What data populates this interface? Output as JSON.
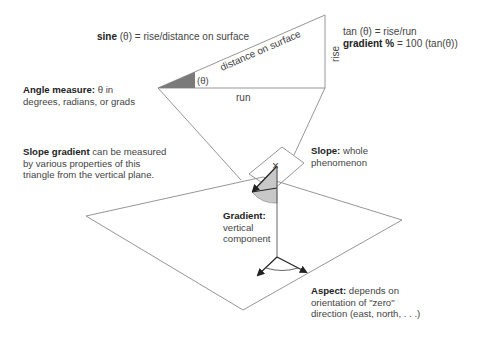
{
  "formulas": {
    "sine_bold": "sine",
    "sine_rest": " (θ) = rise/distance on surface",
    "tan": "tan (θ) = rise/run",
    "gradient_bold": "gradient %",
    "gradient_rest": " = 100 (tan(θ))"
  },
  "triangle": {
    "hypotenuse_label": "distance on surface",
    "vertical_label": "rise",
    "base_label": "run",
    "angle_label": "(θ)"
  },
  "annotations": {
    "angle_measure": {
      "title": "Angle measure:",
      "line1_rest": " θ in",
      "line2": "degrees, radians, or grads"
    },
    "slope_gradient": {
      "title": "Slope gradient",
      "line1_rest": " can be measured",
      "line2": "by various properties of this",
      "line3": "triangle from the vertical plane."
    },
    "slope": {
      "title": "Slope:",
      "line1_rest": " whole",
      "line2": "phenomenon"
    },
    "gradient": {
      "title": "Gradient:",
      "line2": "vertical",
      "line3": "component"
    },
    "aspect": {
      "title": "Aspect:",
      "line1_rest": " depends on",
      "line2": "orientation of \"zero\"",
      "line3": "direction (east, north, . . .)"
    }
  },
  "markers": {
    "point_marker": "×"
  },
  "colors": {
    "line": "#8a8a8a",
    "dark_wedge": "#7a7a7a",
    "light_wedge": "#c8c8c8",
    "arrow": "#222222"
  }
}
